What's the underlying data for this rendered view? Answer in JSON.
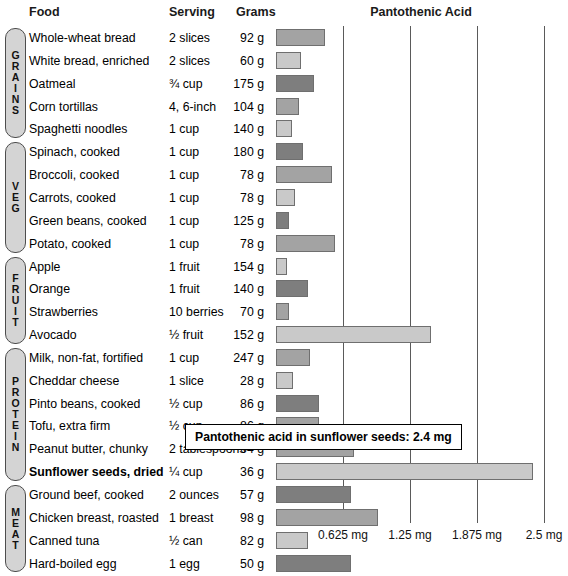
{
  "header": {
    "food": "Food",
    "serving": "Serving",
    "grams": "Grams",
    "chart_title": "Pantothenic Acid"
  },
  "groups": [
    {
      "name": "GRAINS",
      "letters": [
        "G",
        "R",
        "A",
        "I",
        "N",
        "S"
      ],
      "start": 0,
      "count": 5
    },
    {
      "name": "VEG",
      "letters": [
        "V",
        "E",
        "G"
      ],
      "start": 5,
      "count": 5
    },
    {
      "name": "FRUIT",
      "letters": [
        "F",
        "R",
        "U",
        "I",
        "T"
      ],
      "start": 10,
      "count": 4
    },
    {
      "name": "PROTEIN",
      "letters": [
        "P",
        "R",
        "O",
        "T",
        "E",
        "I",
        "N"
      ],
      "start": 14,
      "count": 6
    },
    {
      "name": "MEAT",
      "letters": [
        "M",
        "E",
        "A",
        "T"
      ],
      "start": 20,
      "count": 4
    }
  ],
  "callout": {
    "text": "Pantothenic acid in sunflower seeds: 2.4 mg"
  },
  "axis": {
    "labels": [
      "0.625 mg",
      "1.25 mg",
      "1.875 mg",
      "2.5 mg"
    ],
    "values": [
      0.625,
      1.25,
      1.875,
      2.5
    ]
  },
  "chart_data": {
    "type": "bar",
    "title": "Pantothenic Acid",
    "xlabel": "",
    "ylabel": "",
    "orientation": "horizontal",
    "xlim": [
      0,
      2.7
    ],
    "unit": "mg",
    "grid": true,
    "gridlines": [
      0.625,
      1.25,
      1.875,
      2.5
    ],
    "legend": "none",
    "annotations": [
      "Pantothenic acid in sunflower seeds: 2.4 mg"
    ],
    "columns": [
      "Food",
      "Serving",
      "Grams",
      "Pantothenic Acid"
    ],
    "categories": [
      "Whole-wheat bread",
      "White bread, enriched",
      "Oatmeal",
      "Corn tortillas",
      "Spaghetti noodles",
      "Spinach, cooked",
      "Broccoli, cooked",
      "Carrots, cooked",
      "Green beans, cooked",
      "Potato, cooked",
      "Apple",
      "Orange",
      "Strawberries",
      "Avocado",
      "Milk, non-fat, fortified",
      "Cheddar cheese",
      "Pinto beans, cooked",
      "Tofu, extra firm",
      "Peanut butter, chunky",
      "Sunflower seeds, dried",
      "Ground beef, cooked",
      "Chicken breast, roasted",
      "Canned tuna",
      "Hard-boiled egg"
    ],
    "values": [
      0.46,
      0.23,
      0.35,
      0.21,
      0.15,
      0.25,
      0.52,
      0.18,
      0.12,
      0.55,
      0.1,
      0.3,
      0.12,
      1.45,
      0.32,
      0.16,
      0.4,
      0.4,
      0.73,
      2.4,
      0.7,
      0.95,
      0.3,
      0.7
    ],
    "rows": [
      {
        "food": "Whole-wheat bread",
        "serving": "2 slices",
        "grams": "92 g",
        "value": 0.46,
        "tone": "a"
      },
      {
        "food": "White bread, enriched",
        "serving": "2 slices",
        "grams": "60 g",
        "value": 0.23,
        "tone": "b"
      },
      {
        "food": "Oatmeal",
        "serving": "¾ cup",
        "grams": "175 g",
        "value": 0.35,
        "tone": "c"
      },
      {
        "food": "Corn tortillas",
        "serving": "4, 6-inch",
        "grams": "104 g",
        "value": 0.21,
        "tone": "a"
      },
      {
        "food": "Spaghetti noodles",
        "serving": "1 cup",
        "grams": "140 g",
        "value": 0.15,
        "tone": "b"
      },
      {
        "food": "Spinach, cooked",
        "serving": "1 cup",
        "grams": "180 g",
        "value": 0.25,
        "tone": "c"
      },
      {
        "food": "Broccoli, cooked",
        "serving": "1 cup",
        "grams": "78 g",
        "value": 0.52,
        "tone": "a"
      },
      {
        "food": "Carrots, cooked",
        "serving": "1 cup",
        "grams": "78 g",
        "value": 0.18,
        "tone": "b"
      },
      {
        "food": "Green beans, cooked",
        "serving": "1 cup",
        "grams": "125 g",
        "value": 0.12,
        "tone": "c"
      },
      {
        "food": "Potato, cooked",
        "serving": "1 cup",
        "grams": "78 g",
        "value": 0.55,
        "tone": "a"
      },
      {
        "food": "Apple",
        "serving": "1 fruit",
        "grams": "154 g",
        "value": 0.1,
        "tone": "b"
      },
      {
        "food": "Orange",
        "serving": "1 fruit",
        "grams": "140 g",
        "value": 0.3,
        "tone": "c"
      },
      {
        "food": "Strawberries",
        "serving": "10 berries",
        "grams": "70 g",
        "value": 0.12,
        "tone": "a"
      },
      {
        "food": "Avocado",
        "serving": "½ fruit",
        "grams": "152 g",
        "value": 1.45,
        "tone": "b"
      },
      {
        "food": "Milk, non-fat, fortified",
        "serving": "1 cup",
        "grams": "247 g",
        "value": 0.32,
        "tone": "a"
      },
      {
        "food": "Cheddar cheese",
        "serving": "1 slice",
        "grams": "28 g",
        "value": 0.16,
        "tone": "b"
      },
      {
        "food": "Pinto beans, cooked",
        "serving": "½ cup",
        "grams": "86 g",
        "value": 0.4,
        "tone": "c"
      },
      {
        "food": "Tofu, extra firm",
        "serving": "½ cup",
        "grams": "86 g",
        "value": 0.4,
        "tone": "a"
      },
      {
        "food": "Peanut butter, chunky",
        "serving": "2 tablespoons",
        "grams": "64 g",
        "value": 0.73,
        "tone": "a"
      },
      {
        "food": "Sunflower seeds, dried",
        "serving": "¼ cup",
        "grams": "36 g",
        "value": 2.4,
        "tone": "b",
        "bold": true
      },
      {
        "food": "Ground beef, cooked",
        "serving": "2 ounces",
        "grams": "57 g",
        "value": 0.7,
        "tone": "c"
      },
      {
        "food": "Chicken breast, roasted",
        "serving": "1 breast",
        "grams": "98 g",
        "value": 0.95,
        "tone": "a"
      },
      {
        "food": "Canned tuna",
        "serving": "½ can",
        "grams": "82 g",
        "value": 0.3,
        "tone": "b"
      },
      {
        "food": "Hard-boiled egg",
        "serving": "1 egg",
        "grams": "50 g",
        "value": 0.7,
        "tone": "c"
      }
    ]
  }
}
